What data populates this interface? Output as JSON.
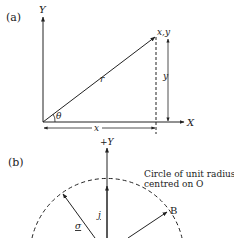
{
  "panel_a": {
    "label": "(a)",
    "axis_y": "Y",
    "axis_x": "X",
    "point_label": "x,y",
    "radius_label": "r",
    "angle_label": "θ",
    "x_dimension": "x",
    "y_dimension": "y"
  },
  "panel_b": {
    "label": "(b)",
    "axis_y": "+Y",
    "circle_note_line1": "Circle of unit radius,",
    "circle_note_line2": "centred on O",
    "vector_j": "j",
    "vector_sigma": "σ",
    "point_b": "B"
  }
}
